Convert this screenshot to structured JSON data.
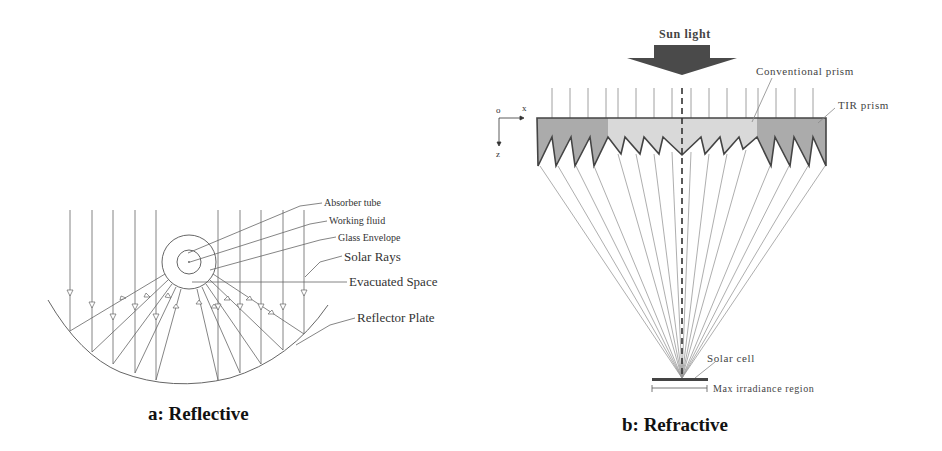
{
  "figure": {
    "panel_a": {
      "caption": "a: Reflective",
      "labels": {
        "absorber_tube": "Absorber tube",
        "working_fluid": "Working fluid",
        "glass_envelope": "Glass Envelope",
        "solar_rays": "Solar Rays",
        "evacuated_space": "Evacuated Space",
        "reflector_plate": "Reflector Plate"
      }
    },
    "panel_b": {
      "caption": "b: Refractive",
      "labels": {
        "sun_light": "Sun light",
        "conventional_prism": "Conventional prism",
        "tir_prism": "TIR prism",
        "solar_cell": "Solar cell",
        "max_irradiance_region": "Max irradiance region"
      },
      "axes": {
        "origin": "o",
        "x": "x",
        "z": "z"
      }
    }
  },
  "colors": {
    "line": "#555555",
    "light_line": "#888888",
    "prism_dark": "#a9a9a9",
    "prism_light": "#d6d6d6",
    "arrow_fill": "#4a4a4a"
  }
}
